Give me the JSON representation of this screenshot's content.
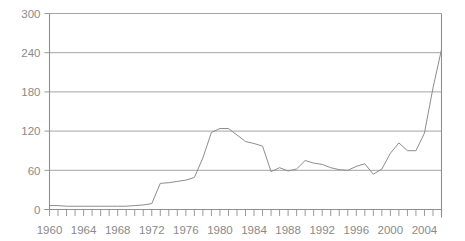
{
  "chart_data": {
    "type": "line",
    "title": "",
    "subtitle": "",
    "xlabel": "",
    "ylabel": "",
    "grid": true,
    "legend": null,
    "xlim": [
      1960,
      2006
    ],
    "ylim": [
      0,
      300
    ],
    "y_ticks": [
      0,
      60,
      120,
      180,
      240,
      300
    ],
    "y_tick_labels": [
      "0",
      "60",
      "120",
      "180",
      "240",
      "300"
    ],
    "x_tick_labels": [
      "1960",
      "1964",
      "1968",
      "1972",
      "1976",
      "1980",
      "1984",
      "1988",
      "1992",
      "1996",
      "2000",
      "2004"
    ],
    "x_tick_step_minor": 1,
    "x_tick_step_major": 4,
    "series": [
      {
        "name": "value",
        "color": "#8d8d8d",
        "x": [
          1960,
          1961,
          1962,
          1963,
          1964,
          1965,
          1966,
          1967,
          1968,
          1969,
          1970,
          1971,
          1972,
          1973,
          1974,
          1975,
          1976,
          1977,
          1978,
          1979,
          1980,
          1981,
          1982,
          1983,
          1984,
          1985,
          1986,
          1987,
          1988,
          1989,
          1990,
          1991,
          1992,
          1993,
          1994,
          1995,
          1996,
          1997,
          1998,
          1999,
          2000,
          2001,
          2002,
          2003,
          2004,
          2005,
          2006
        ],
        "values": [
          6,
          6,
          5,
          5,
          5,
          5,
          5,
          5,
          5,
          5,
          6,
          7,
          9,
          40,
          41,
          43,
          45,
          49,
          79,
          118,
          124,
          124,
          114,
          104,
          101,
          97,
          58,
          64,
          59,
          62,
          75,
          71,
          69,
          64,
          61,
          60,
          66,
          70,
          54,
          62,
          86,
          102,
          90,
          90,
          117,
          186,
          245
        ]
      }
    ]
  }
}
